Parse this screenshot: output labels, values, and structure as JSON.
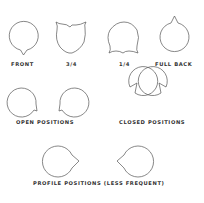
{
  "diagram": {
    "stroke_color": "#555555",
    "label_color": "#333333",
    "background": "#ffffff",
    "shapes": [
      {
        "id": "front",
        "label": "FRONT",
        "feature": "point-bottom"
      },
      {
        "id": "three-quarter",
        "label": "3/4",
        "feature": "two-points-top"
      },
      {
        "id": "one-quarter",
        "label": "1/4",
        "feature": "two-points-bottom"
      },
      {
        "id": "full-back",
        "label": "FULL BACK",
        "feature": "point-top"
      },
      {
        "id": "open-left",
        "feature": "point-bottom-right"
      },
      {
        "id": "open-right",
        "feature": "point-bottom-left"
      },
      {
        "id": "closed-left",
        "feature": "point-top-right"
      },
      {
        "id": "closed-right",
        "feature": "point-top-left"
      },
      {
        "id": "profile-left",
        "feature": "point-right"
      },
      {
        "id": "profile-right",
        "feature": "point-left"
      }
    ],
    "labels": {
      "front": "FRONT",
      "three_quarter": "3/4",
      "one_quarter": "1/4",
      "full_back": "FULL BACK",
      "open_positions": "OPEN  POSITIONS",
      "closed_positions": "CLOSED  POSITIONS",
      "profile_positions": "PROFILE  POSITIONS  (LESS  FREQUENT)"
    }
  }
}
